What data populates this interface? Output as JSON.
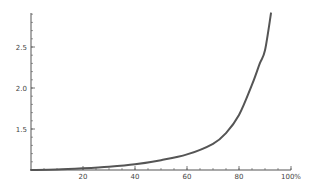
{
  "chart_data": {
    "type": "line",
    "title": "",
    "xlabel": "",
    "ylabel": "",
    "xlim": [
      0,
      100
    ],
    "ylim": [
      1.0,
      2.9
    ],
    "grid": false,
    "legend": null,
    "x_ticks": [
      {
        "value": 20,
        "label": "20"
      },
      {
        "value": 40,
        "label": "40"
      },
      {
        "value": 60,
        "label": "60"
      },
      {
        "value": 80,
        "label": "80"
      },
      {
        "value": 100,
        "label": "100%"
      }
    ],
    "y_ticks": [
      {
        "value": 1.5,
        "label": "1.5"
      },
      {
        "value": 2.0,
        "label": "2.0"
      },
      {
        "value": 2.5,
        "label": "2.5"
      }
    ],
    "series": [
      {
        "name": "curve",
        "color": "#555555",
        "x": [
          0,
          10,
          20,
          30,
          40,
          50,
          60,
          70,
          75,
          80,
          85,
          88,
          90,
          92.3
        ],
        "values": [
          1.0,
          1.005,
          1.02,
          1.04,
          1.07,
          1.12,
          1.19,
          1.32,
          1.45,
          1.67,
          2.04,
          2.3,
          2.46,
          2.91
        ]
      }
    ]
  },
  "colors": {
    "axis": "#555555",
    "curve": "#555555",
    "background": "#ffffff"
  }
}
